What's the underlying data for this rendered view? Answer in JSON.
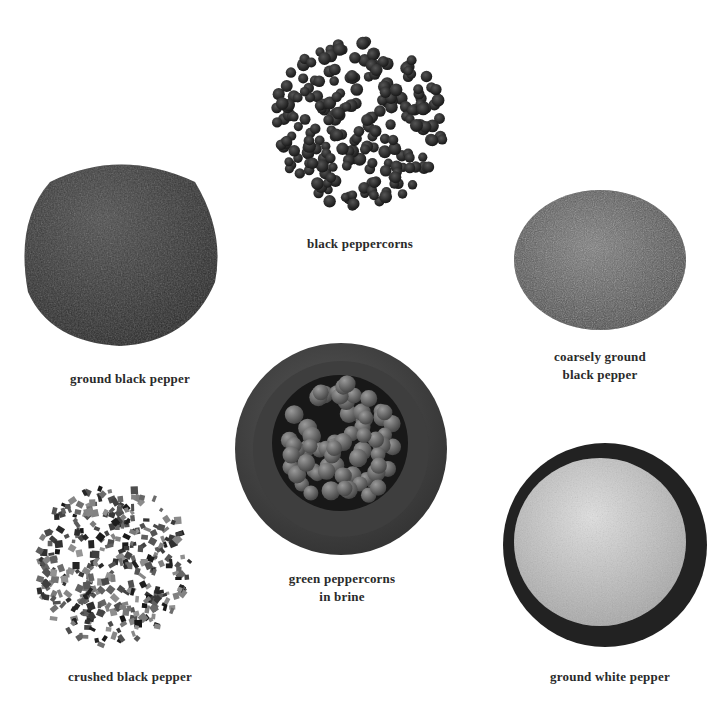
{
  "figure": {
    "items": [
      {
        "id": "black-peppercorns",
        "label_lines": [
          "black peppercorns"
        ]
      },
      {
        "id": "coarsely-ground",
        "label_lines": [
          "coarsely ground",
          "black pepper"
        ]
      },
      {
        "id": "ground-black",
        "label_lines": [
          "ground black pepper"
        ]
      },
      {
        "id": "green-peppercorns",
        "label_lines": [
          "green peppercorns",
          "in brine"
        ]
      },
      {
        "id": "crushed-black",
        "label_lines": [
          "crushed black pepper"
        ]
      },
      {
        "id": "ground-white",
        "label_lines": [
          "ground white pepper"
        ]
      }
    ],
    "colors": {
      "background": "#ffffff",
      "label": "#2a2a2a",
      "black_pepper": "#2b2b2b",
      "ground_black": "#3d3d3d",
      "coarse": "#6a6a6a",
      "bowl": "#4a4a4a",
      "green_pepper": "#6d6d6d",
      "white_pepper": "#c9c9c9"
    }
  }
}
